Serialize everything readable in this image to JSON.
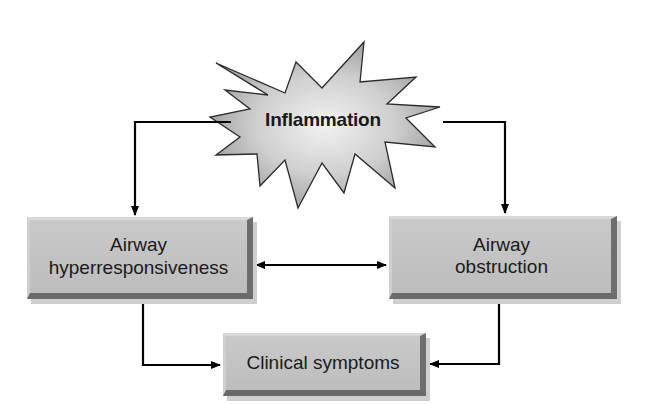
{
  "diagram": {
    "nodes": {
      "inflammation": {
        "label": "Inflammation",
        "shape": "starburst"
      },
      "hyperresponsiveness": {
        "line1": "Airway",
        "line2": "hyperresponsiveness",
        "shape": "bevel-box"
      },
      "obstruction": {
        "line1": "Airway",
        "line2": "obstruction",
        "shape": "bevel-box"
      },
      "symptoms": {
        "label": "Clinical symptoms",
        "shape": "bevel-box"
      }
    },
    "edges": [
      {
        "from": "Inflammation",
        "to": "Airway hyperresponsiveness",
        "direction": "forward"
      },
      {
        "from": "Inflammation",
        "to": "Airway obstruction",
        "direction": "forward"
      },
      {
        "from": "Airway hyperresponsiveness",
        "to": "Airway obstruction",
        "direction": "bidirectional"
      },
      {
        "from": "Airway hyperresponsiveness",
        "to": "Clinical symptoms",
        "direction": "forward"
      },
      {
        "from": "Airway obstruction",
        "to": "Clinical symptoms",
        "direction": "forward"
      }
    ],
    "colors": {
      "box_fill": "#c4c4c4",
      "box_dark_edge": "#6a6a6a",
      "burst_fill": "#b8b8b8",
      "arrow": "#000000",
      "background": "#ffffff"
    }
  }
}
